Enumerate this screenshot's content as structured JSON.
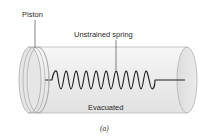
{
  "figure": {
    "labels": {
      "piston": "Piston",
      "spring": "Unstrained spring",
      "chamber": "Evacuated"
    },
    "caption": "(a)",
    "colors": {
      "cylinder_fill": "#eeeeee",
      "cylinder_edge": "#b8b8b8",
      "cap_fill": "#e4e4e4",
      "spring": "#1e1e1e",
      "leader_line": "#333333",
      "text": "#2a2a2a"
    },
    "components": [
      "piston-icon",
      "cylinder-icon",
      "spring-icon",
      "end-cap-icon"
    ]
  }
}
